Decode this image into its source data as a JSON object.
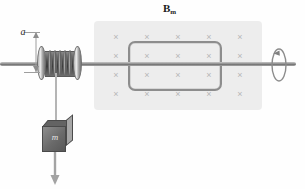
{
  "figure": {
    "title": "",
    "background_color": "#fefefe"
  },
  "field_region": {
    "label": "B",
    "label_subscript": "m",
    "fill_color": "#ededed",
    "direction": "into-page",
    "marker_glyph": "×",
    "marker_color": "#b6b6b6",
    "marker_rows": 4,
    "marker_cols": 5,
    "marker_name": "field-into-page-marker"
  },
  "loop": {
    "name": "current-loop",
    "shape": "rounded-rectangle",
    "stroke_color": "#8d8d8d"
  },
  "axle": {
    "name": "rotation-axle",
    "color": "#8f8f8f"
  },
  "rotation": {
    "name": "rotation-direction-arrow",
    "color": "#8c8c8c"
  },
  "spool": {
    "name": "spool-drum",
    "flange_color": "#9b9b9b",
    "drum_color": "#4b4b4b",
    "coil_count": 6
  },
  "dimension": {
    "label": "a",
    "name": "radius-dimension-a",
    "line_color": "#9e9e9e"
  },
  "mass": {
    "label": "m",
    "name": "hanging-mass-block",
    "front_color": "#6a6a6a",
    "top_color": "#636363",
    "side_color": "#a6a6a6"
  },
  "string": {
    "name": "suspension-string",
    "color": "#9a9a9a"
  },
  "force_arrow": {
    "name": "weight-direction-arrow",
    "color": "#9e9e9e",
    "direction": "down"
  }
}
